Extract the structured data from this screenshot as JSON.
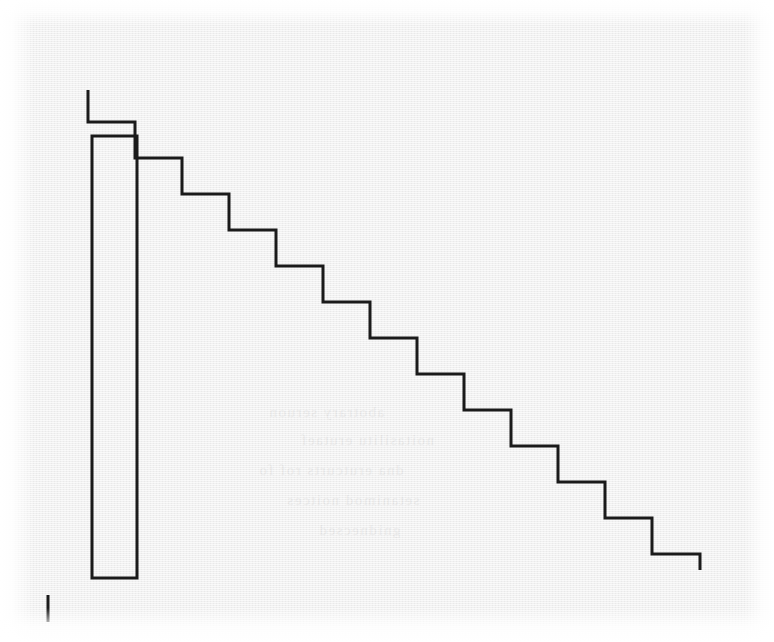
{
  "figure": {
    "canvas": {
      "width": 774,
      "height": 642
    },
    "background_color": "#efefef",
    "ink_color": "#1a1a1a",
    "paper_color": "#ffffff"
  },
  "chart_data": {
    "type": "line",
    "xlabel": "",
    "ylabel": "",
    "grid": false,
    "legend": null,
    "xlim": [
      0,
      774
    ],
    "ylim": [
      642,
      0
    ],
    "stroke_width": 3,
    "series": [
      {
        "name": "staircase-outline",
        "description": "Open polyline descending left-to-right in 13 equal steps, each tread 47 px wide and each riser 36 px tall",
        "step_count": 13,
        "tread_width": 47,
        "riser_height": 36,
        "start_point": [
          88,
          90
        ],
        "end_point": [
          700,
          570
        ],
        "points": [
          [
            88,
            90
          ],
          [
            88,
            122
          ],
          [
            135,
            122
          ],
          [
            135,
            158
          ],
          [
            182,
            158
          ],
          [
            182,
            194
          ],
          [
            229,
            194
          ],
          [
            229,
            230
          ],
          [
            276,
            230
          ],
          [
            276,
            266
          ],
          [
            323,
            266
          ],
          [
            323,
            302
          ],
          [
            370,
            302
          ],
          [
            370,
            338
          ],
          [
            417,
            338
          ],
          [
            417,
            374
          ],
          [
            464,
            374
          ],
          [
            464,
            410
          ],
          [
            511,
            410
          ],
          [
            511,
            446
          ],
          [
            558,
            446
          ],
          [
            558,
            482
          ],
          [
            605,
            482
          ],
          [
            605,
            518
          ],
          [
            652,
            518
          ],
          [
            652,
            554
          ],
          [
            700,
            554
          ],
          [
            700,
            570
          ]
        ]
      },
      {
        "name": "left-vertical-bar",
        "description": "Tall narrow unfilled rectangle at the left of the staircase",
        "shape": "rectangle",
        "x": 92,
        "y": 136,
        "width": 45,
        "height": 442,
        "fill": "none"
      },
      {
        "name": "baseline-tick",
        "description": "Short vertical tick mark near the bottom-left corner",
        "shape": "line",
        "x": 48,
        "y_top": 595,
        "y_bottom": 622,
        "length": 27
      }
    ]
  },
  "bleed_through": {
    "lines": [
      {
        "text": "abotrary seruon",
        "left": 268,
        "top": 404
      },
      {
        "text": "noitasilitu erutaef",
        "left": 300,
        "top": 432
      },
      {
        "text": "dna erutcurts rof fo",
        "left": 258,
        "top": 462
      },
      {
        "text": "setanimod noitces",
        "left": 286,
        "top": 492
      },
      {
        "text": "gnidnecsed",
        "left": 318,
        "top": 522
      }
    ]
  }
}
